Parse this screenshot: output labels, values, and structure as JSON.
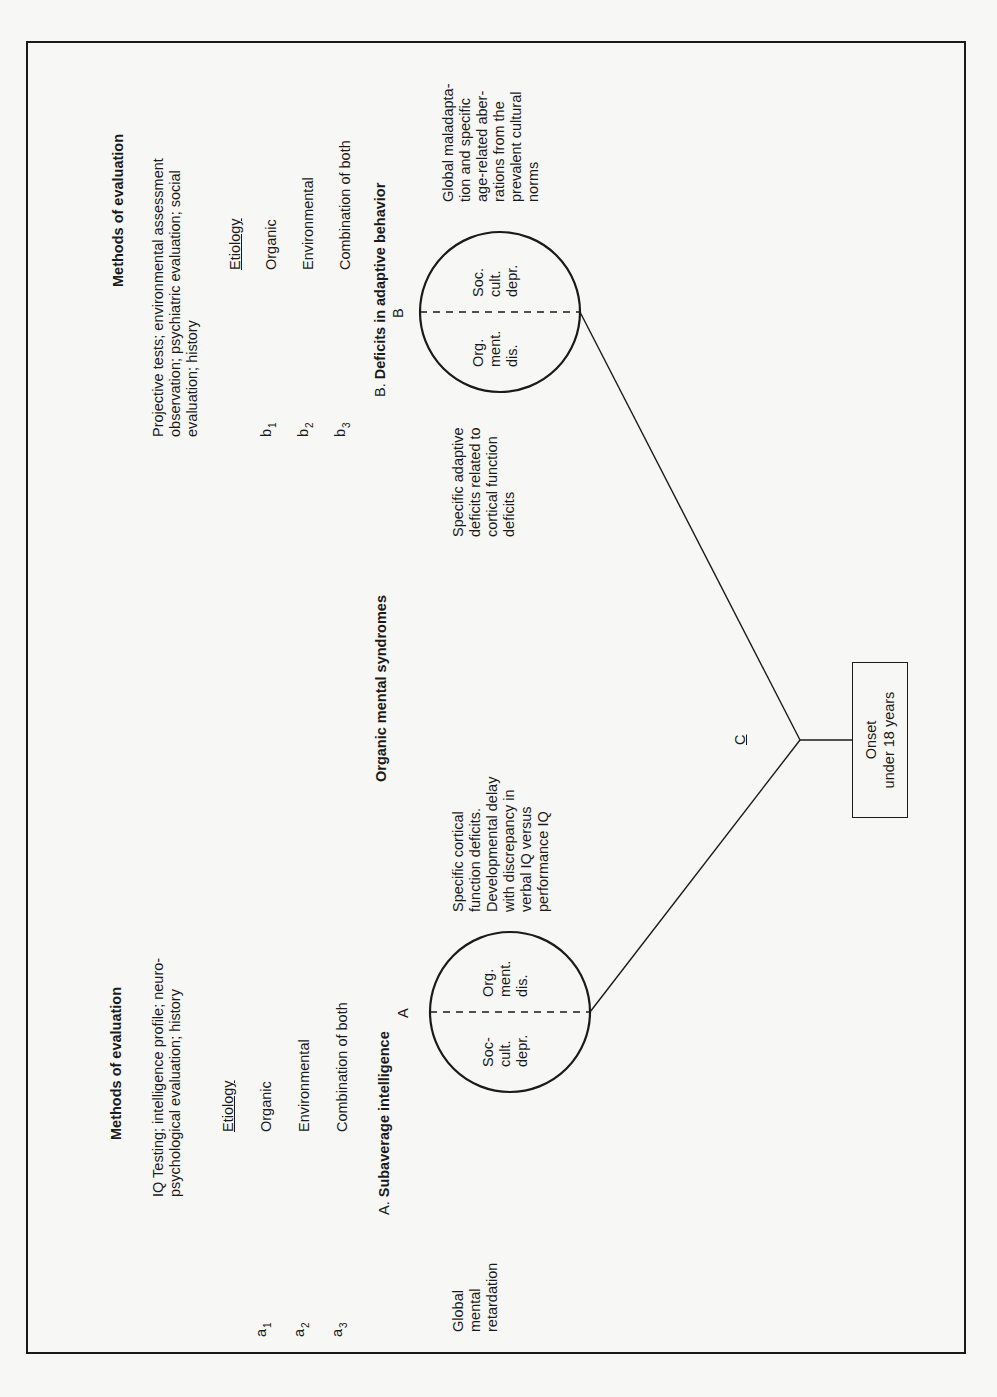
{
  "figure": {
    "orientation": "rotated 90 degrees counter-clockwise",
    "center_title": "Organic mental syndromes",
    "left_section": {
      "methods_title": "Methods of evaluation",
      "methods_text_lines": [
        "IQ Testing; intelligence profile; neuro-",
        "psychological evaluation; history"
      ],
      "etiology_header": "Etiology",
      "etiology": [
        {
          "label": "a",
          "sub": "1",
          "value": "Organic"
        },
        {
          "label": "a",
          "sub": "2",
          "value": "Environmental"
        },
        {
          "label": "a",
          "sub": "3",
          "value": "Combination of both"
        }
      ],
      "axis_heading_prefix": "A.",
      "axis_heading": "Subaverage intelligence",
      "circle_letter": "A",
      "circle_left_lines": [
        "Soc-",
        "cult.",
        "depr."
      ],
      "circle_right_lines": [
        "Org.",
        "ment.",
        "dis."
      ],
      "outer_left_lines": [
        "Global",
        "mental",
        "retardation"
      ],
      "outer_right_lines": [
        "Specific cortical",
        "function deficits.",
        "Developmental delay",
        "with discrepancy in",
        "verbal IQ versus",
        "performance IQ"
      ]
    },
    "right_section": {
      "methods_title": "Methods of evaluation",
      "methods_text_lines": [
        "Projective tests; environmental assessment",
        "observation; psychiatric evaluation; social",
        "evaluation; history"
      ],
      "etiology_header": "Etiology",
      "etiology": [
        {
          "label": "b",
          "sub": "1",
          "value": "Organic"
        },
        {
          "label": "b",
          "sub": "2",
          "value": "Environmental"
        },
        {
          "label": "b",
          "sub": "3",
          "value": "Combination of both"
        }
      ],
      "axis_heading_prefix": "B.",
      "axis_heading": "Deficits in adaptive behavior",
      "circle_letter": "B",
      "circle_left_lines": [
        "Org.",
        "ment.",
        "dis."
      ],
      "circle_right_lines": [
        "Soc.",
        "cult.",
        "depr."
      ],
      "outer_left_lines": [
        "Specific adaptive",
        "deficits related to",
        "cortical function",
        "deficits"
      ],
      "outer_right_lines": [
        "Global maladapta-",
        "tion and specific",
        "age-related aber-",
        "rations from the",
        "prevalent cultural",
        "norms"
      ]
    },
    "vertex_label": "C",
    "onset_box_lines": [
      "Onset",
      "under 18 years"
    ]
  }
}
